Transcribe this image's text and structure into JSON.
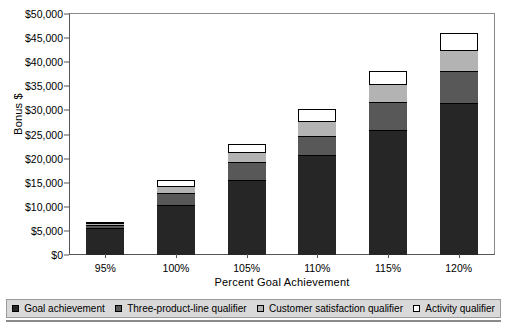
{
  "chart_data": {
    "type": "bar",
    "stacked": true,
    "title": "",
    "xlabel": "Percent Goal Achievement",
    "ylabel": "Bonus $",
    "categories": [
      "95%",
      "100%",
      "105%",
      "110%",
      "115%",
      "120%"
    ],
    "ylim": [
      0,
      50000
    ],
    "ytick_values": [
      0,
      5000,
      10000,
      15000,
      20000,
      25000,
      30000,
      35000,
      40000,
      45000,
      50000
    ],
    "ytick_labels": [
      "$0",
      "$5,000",
      "$10,000",
      "$15,000",
      "$20,000",
      "$25,000",
      "$30,000",
      "$35,000",
      "$40,000",
      "$45,000",
      "$50,000"
    ],
    "grid": false,
    "legend_position": "bottom",
    "series": [
      {
        "name": "Goal achievement",
        "color": "#262626",
        "values": [
          5600,
          10400,
          15500,
          20700,
          26000,
          31500
        ]
      },
      {
        "name": "Three-product-line qualifier",
        "color": "#585858",
        "values": [
          700,
          2400,
          3800,
          4000,
          5700,
          6700
        ]
      },
      {
        "name": "Customer satisfaction qualifier",
        "color": "#b3b3b3",
        "values": [
          200,
          1500,
          2100,
          3200,
          3700,
          4300
        ]
      },
      {
        "name": "Activity qualifier",
        "color": "#ffffff",
        "values": [
          300,
          1200,
          1600,
          2400,
          2800,
          3500
        ]
      }
    ],
    "totals": [
      6800,
      15500,
      23000,
      30300,
      38200,
      46000
    ]
  }
}
